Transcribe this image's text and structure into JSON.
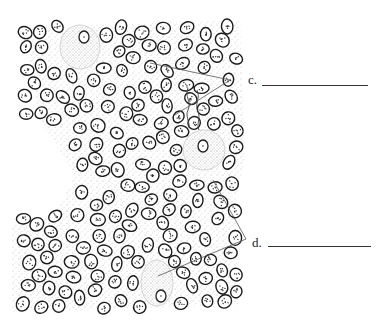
{
  "figure": {
    "type": "histology-illustration",
    "colors": {
      "ink": "#222222",
      "stipple": "#9a9a9a",
      "background": "#ffffff"
    }
  },
  "labels": [
    {
      "id": "c",
      "text": "c.",
      "blank": "",
      "x": 252,
      "y": 80,
      "line_from": 262,
      "line_to": 368,
      "leaders": [
        [
          230,
          80,
          150,
          63
        ],
        [
          230,
          80,
          175,
          115
        ]
      ]
    },
    {
      "id": "d",
      "text": "d.",
      "blank": "",
      "x": 253,
      "y": 243,
      "line_from": 268,
      "line_to": 371,
      "leaders": [
        [
          246,
          239,
          213,
          180
        ],
        [
          246,
          239,
          158,
          276
        ]
      ]
    }
  ],
  "large_cells": [
    {
      "cx": 80,
      "cy": 47,
      "rx": 20,
      "ry": 22,
      "nx": 84,
      "ny": 37
    },
    {
      "cx": 204,
      "cy": 150,
      "rx": 21,
      "ry": 20,
      "nx": 203,
      "ny": 146
    },
    {
      "cx": 157,
      "cy": 283,
      "rx": 16,
      "ry": 23,
      "nx": 161,
      "ny": 296
    }
  ]
}
